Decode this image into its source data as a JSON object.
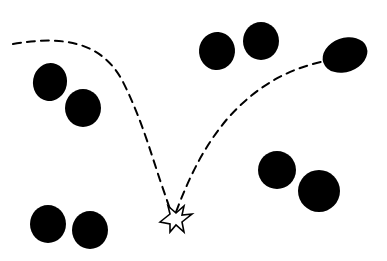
{
  "diagram": {
    "colors": {
      "ink": "#000000",
      "background": "#ffffff"
    },
    "dots": [
      {
        "id": "top-left-a",
        "cx": 50,
        "cy": 82,
        "rx": 17,
        "ry": 19,
        "rot": 10
      },
      {
        "id": "top-left-b",
        "cx": 83,
        "cy": 108,
        "rx": 18,
        "ry": 19,
        "rot": 0
      },
      {
        "id": "top-mid-a",
        "cx": 217,
        "cy": 51,
        "rx": 18,
        "ry": 19,
        "rot": 5
      },
      {
        "id": "top-mid-b",
        "cx": 261,
        "cy": 41,
        "rx": 18,
        "ry": 19,
        "rot": 0
      },
      {
        "id": "top-right",
        "cx": 345,
        "cy": 55,
        "rx": 23,
        "ry": 17,
        "rot": -20
      },
      {
        "id": "mid-right-a",
        "cx": 277,
        "cy": 170,
        "rx": 19,
        "ry": 19,
        "rot": 0
      },
      {
        "id": "mid-right-b",
        "cx": 319,
        "cy": 191,
        "rx": 21,
        "ry": 21,
        "rot": 0
      },
      {
        "id": "bottom-left-a",
        "cx": 48,
        "cy": 224,
        "rx": 18,
        "ry": 19,
        "rot": 0
      },
      {
        "id": "bottom-left-b",
        "cx": 90,
        "cy": 230,
        "rx": 18,
        "ry": 19,
        "rot": 0
      }
    ],
    "trajectory_in": "M13,44 C60,36 100,40 122,80 C140,115 150,150 160,180 L171,212",
    "trajectory_out": "M176,212 C190,175 205,145 228,118 C255,88 285,70 321,62",
    "impact_star": "M160,222 L170,214 L168,206 L176,213 L184,206 L182,215 L192,214 L182,222 L184,232 L176,225 L170,232 L170,224 Z"
  }
}
